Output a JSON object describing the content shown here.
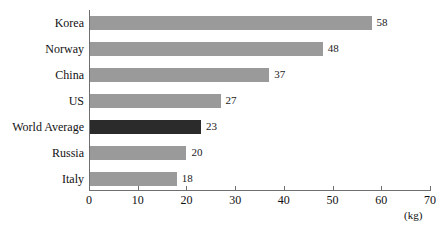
{
  "chart_data": {
    "type": "bar",
    "orientation": "horizontal",
    "title": "",
    "xlabel": "(kg)",
    "ylabel": "",
    "xlim": [
      0,
      70
    ],
    "xticks": [
      0,
      10,
      20,
      30,
      40,
      50,
      60,
      70
    ],
    "grid": false,
    "legend": null,
    "categories": [
      "Korea",
      "Norway",
      "China",
      "US",
      "World Average",
      "Russia",
      "Italy"
    ],
    "values": [
      58,
      48,
      37,
      27,
      23,
      20,
      18
    ],
    "value_labels": [
      "58",
      "48",
      "37",
      "27",
      "23",
      "20",
      "18"
    ],
    "highlight_category": "World Average",
    "colors": {
      "bar": "#9a9a9a",
      "bar_highlight": "#2b2b2b",
      "axis": "#6f6f6f",
      "text": "#1a1a1a",
      "background": "#ffffff"
    }
  },
  "axis": {
    "unit_label": "(kg)",
    "tick_labels": [
      "0",
      "10",
      "20",
      "30",
      "40",
      "50",
      "60",
      "70"
    ]
  },
  "title_remnant": ""
}
